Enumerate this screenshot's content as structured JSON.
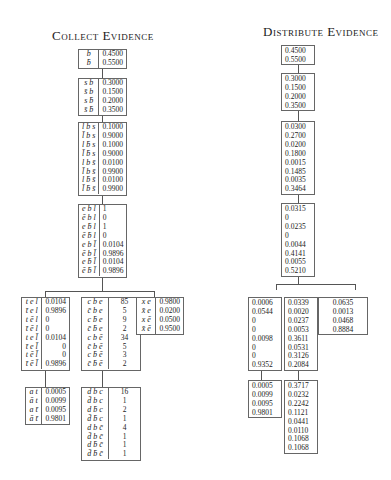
{
  "titles": {
    "collect": "Collect Evidence",
    "distribute": "Distribute Evidence"
  },
  "collect": {
    "b": {
      "rows": [
        {
          "label": "b",
          "value": "0.4500"
        },
        {
          "label": "b̄",
          "value": "0.5500"
        }
      ]
    },
    "sb": {
      "rows": [
        {
          "label": "s b",
          "value": "0.3000"
        },
        {
          "label": "s̄ b",
          "value": "0.1500"
        },
        {
          "label": "s b̄",
          "value": "0.2000"
        },
        {
          "label": "s̄ b̄",
          "value": "0.3500"
        }
      ]
    },
    "lbs": {
      "rows": [
        {
          "label": "l b s",
          "value": "0.1000"
        },
        {
          "label": "l̄ b s",
          "value": "0.9000"
        },
        {
          "label": "l b̄ s",
          "value": "0.1000"
        },
        {
          "label": "l̄ b̄ s",
          "value": "0.9000"
        },
        {
          "label": "l b s̄",
          "value": "0.0100"
        },
        {
          "label": "l̄ b s̄",
          "value": "0.9900"
        },
        {
          "label": "l b̄ s̄",
          "value": "0.0100"
        },
        {
          "label": "l̄ b̄ s̄",
          "value": "0.9900"
        }
      ]
    },
    "ebl": {
      "rows": [
        {
          "label": "e b l",
          "value": "1"
        },
        {
          "label": "ē b l",
          "value": "0"
        },
        {
          "label": "e b̄ l",
          "value": "1"
        },
        {
          "label": "ē b̄ l",
          "value": "0"
        },
        {
          "label": "e b l̄",
          "value": "0.0104"
        },
        {
          "label": "ē b l̄",
          "value": "0.9896"
        },
        {
          "label": "e b̄ l̄",
          "value": "0.0104"
        },
        {
          "label": "ē b̄ l̄",
          "value": "0.9896"
        }
      ]
    },
    "tel": {
      "rows": [
        {
          "label": "t e l",
          "value": "0.0104"
        },
        {
          "label": "t̄ e l",
          "value": "0.9896"
        },
        {
          "label": "t ē l",
          "value": "0"
        },
        {
          "label": "t̄ ē l",
          "value": "0"
        },
        {
          "label": "t e l̄",
          "value": "0.0104"
        },
        {
          "label": "t̄ e l̄",
          "value": "0"
        },
        {
          "label": "t ē l̄",
          "value": "0"
        },
        {
          "label": "t̄ ē l̄",
          "value": "0.9896"
        }
      ]
    },
    "cbe": {
      "rows": [
        {
          "label": "c b e",
          "value": "85"
        },
        {
          "label": "c̄ b e",
          "value": "5"
        },
        {
          "label": "c b̄ e",
          "value": "9"
        },
        {
          "label": "c̄ b̄ e",
          "value": "2"
        },
        {
          "label": "c b ē",
          "value": "34"
        },
        {
          "label": "c̄ b ē",
          "value": "5"
        },
        {
          "label": "c b̄ ē",
          "value": "3"
        },
        {
          "label": "c̄ b̄ ē",
          "value": "2"
        }
      ]
    },
    "xe": {
      "rows": [
        {
          "label": "x e",
          "value": "0.9800"
        },
        {
          "label": "x̄ e",
          "value": "0.0200"
        },
        {
          "label": "x ē",
          "value": "0.0500"
        },
        {
          "label": "x̄ ē",
          "value": "0.9500"
        }
      ]
    },
    "at": {
      "rows": [
        {
          "label": "a t",
          "value": "0.0005"
        },
        {
          "label": "ā t",
          "value": "0.0099"
        },
        {
          "label": "a t̄",
          "value": "0.0095"
        },
        {
          "label": "ā t̄",
          "value": "0.9801"
        }
      ]
    },
    "dbc": {
      "rows": [
        {
          "label": "d b c",
          "value": "16"
        },
        {
          "label": "d̄ b c",
          "value": "1"
        },
        {
          "label": "d b̄ c",
          "value": "2"
        },
        {
          "label": "d̄ b̄ c",
          "value": "1"
        },
        {
          "label": "d b c̄",
          "value": "4"
        },
        {
          "label": "d̄ b c̄",
          "value": "1"
        },
        {
          "label": "d b̄ c̄",
          "value": "1"
        },
        {
          "label": "d̄ b̄ c̄",
          "value": "1"
        }
      ]
    }
  },
  "distribute": {
    "b": [
      "0.4500",
      "0.5500"
    ],
    "sb": [
      "0.3000",
      "0.1500",
      "0.2000",
      "0.3500"
    ],
    "lbs": [
      "0.0300",
      "0.2700",
      "0.0200",
      "0.1800",
      "0.0015",
      "0.1485",
      "0.0035",
      "0.3464"
    ],
    "ebl": [
      "0.0315",
      "0",
      "0.0235",
      "0",
      "0.0044",
      "0.4141",
      "0.0055",
      "0.5210"
    ],
    "tel": [
      "0.0006",
      "0.0544",
      "0",
      "0",
      "0.0098",
      "0",
      "0",
      "0.9352"
    ],
    "cbe": [
      "0.0339",
      "0.0020",
      "0.0237",
      "0.0053",
      "0.3611",
      "0.0531",
      "0.3126",
      "0.2084"
    ],
    "xe": [
      "0.0635",
      "0.0013",
      "0.0468",
      "0.8884"
    ],
    "at": [
      "0.0005",
      "0.0099",
      "0.0095",
      "0.9801"
    ],
    "dbc": [
      "0.3717",
      "0.0232",
      "0.2242",
      "0.1121",
      "0.0441",
      "0.0110",
      "0.1068",
      "0.1068"
    ]
  }
}
